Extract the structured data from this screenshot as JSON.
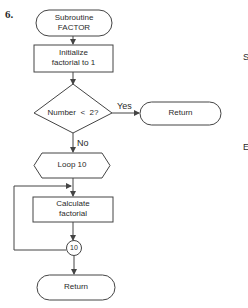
{
  "figure_number": "6.",
  "nodes": {
    "start": {
      "type": "terminal",
      "line1": "Subroutine",
      "line2": "FACTOR"
    },
    "init": {
      "type": "process",
      "line1": "Initialize",
      "line2": "factorial to 1"
    },
    "decision": {
      "type": "decision",
      "label": "Number  <  2?"
    },
    "return_yes": {
      "type": "terminal",
      "label": "Return"
    },
    "loop": {
      "type": "preparation",
      "label": "Loop 10"
    },
    "calc": {
      "type": "process",
      "line1": "Calculate",
      "line2": "factorial"
    },
    "connector": {
      "type": "connector",
      "label": "10"
    },
    "end": {
      "type": "terminal",
      "label": "Return"
    }
  },
  "edges": {
    "yes_label": "Yes",
    "no_label": "No"
  },
  "margin_fragments": {
    "top": "S",
    "bottom": "E"
  },
  "colors": {
    "stroke": "#444444",
    "text": "#2a2a2a",
    "background": "#ffffff"
  }
}
